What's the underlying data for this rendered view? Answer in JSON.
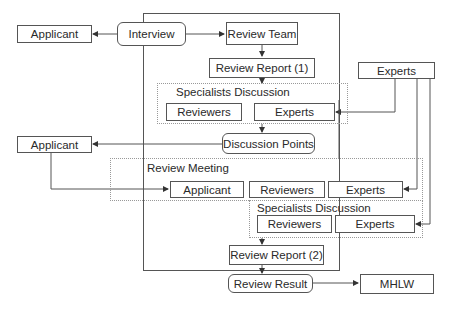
{
  "diagram": {
    "nodes": {
      "applicant_top": "Applicant",
      "interview": "Interview",
      "review_team": "Review Team",
      "review_report_1": "Review Report (1)",
      "experts_right": "Experts",
      "discussion_points": "Discussion Points",
      "applicant_left": "Applicant",
      "review_report_2": "Review Report (2)",
      "review_result": "Review Result",
      "mhlw": "MHLW"
    },
    "groups": {
      "specialists_discussion_1": {
        "label": "Specialists Discussion",
        "members": [
          "Reviewers",
          "Experts"
        ]
      },
      "review_meeting": {
        "label": "Review Meeting",
        "members": [
          "Applicant",
          "Reviewers",
          "Experts"
        ]
      },
      "specialists_discussion_2": {
        "label": "Specialists Discussion",
        "members": [
          "Reviewers",
          "Experts"
        ]
      }
    },
    "edges": [
      {
        "from": "Interview",
        "to": "Applicant"
      },
      {
        "from": "Interview",
        "to": "Review Team"
      },
      {
        "from": "Review Team",
        "to": "Review Report (1)"
      },
      {
        "from": "Review Report (1)",
        "to": "Specialists Discussion"
      },
      {
        "from": "Experts",
        "to": "Specialists Discussion / Experts"
      },
      {
        "from": "Specialists Discussion",
        "to": "Discussion Points"
      },
      {
        "from": "Discussion Points",
        "to": "Applicant"
      },
      {
        "from": "Applicant",
        "to": "Review Meeting / Applicant"
      },
      {
        "from": "Experts",
        "to": "Review Meeting / Experts"
      },
      {
        "from": "Experts",
        "to": "Specialists Discussion (2) / Experts"
      },
      {
        "from": "Specialists Discussion (2)",
        "to": "Review Report (2)"
      },
      {
        "from": "Review Report (2)",
        "to": "Review Result"
      },
      {
        "from": "Review Result",
        "to": "MHLW"
      }
    ]
  }
}
